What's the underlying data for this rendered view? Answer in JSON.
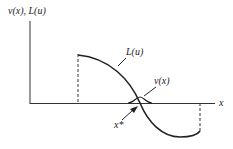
{
  "diagram": {
    "y_axis_label": "v(x), L(u)",
    "x_axis_label": "x",
    "curve_L_label": "L(u)",
    "curve_v_label": "v(x)",
    "point_label": "x*",
    "colors": {
      "line": "#222222",
      "axis": "#333333"
    }
  }
}
